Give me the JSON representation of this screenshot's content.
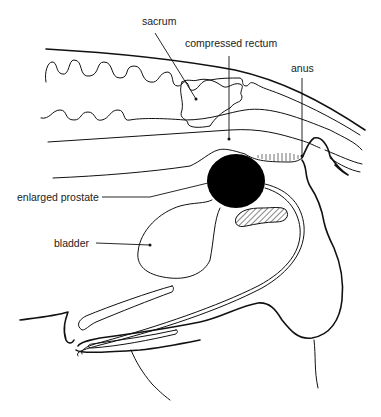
{
  "diagram": {
    "type": "anatomical cross-section",
    "labels": [
      {
        "id": "sacrum",
        "text": "sacrum"
      },
      {
        "id": "compressed_rectum",
        "text": "compressed rectum"
      },
      {
        "id": "anus",
        "text": "anus"
      },
      {
        "id": "enlarged_prostate",
        "text": "enlarged prostate"
      },
      {
        "id": "bladder",
        "text": "bladder"
      }
    ],
    "colors": {
      "line": "#111111",
      "fill_prostate": "#000000",
      "background": "#ffffff"
    }
  }
}
